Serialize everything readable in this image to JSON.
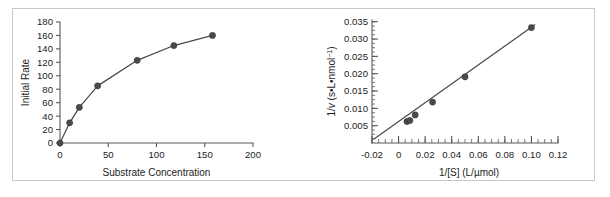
{
  "figure": {
    "background_color": "#ffffff",
    "frame_color": "#c8c8c8",
    "data_color": "#4a4a4c",
    "axis_color": "#58585a",
    "panel_count": 2
  },
  "chart_data": [
    {
      "type": "line",
      "id": "michaelis-menten-plot",
      "title": "",
      "xlabel": "Substrate Concentration",
      "ylabel": "Initial Rate",
      "xlim": [
        0,
        200
      ],
      "ylim": [
        0,
        180
      ],
      "xticks": [
        0,
        50,
        100,
        150,
        200
      ],
      "xticklabels": [
        "0",
        "50",
        "100",
        "150",
        "200"
      ],
      "yticks": [
        0,
        20,
        40,
        60,
        80,
        100,
        120,
        140,
        160,
        180
      ],
      "yticklabels": [
        "0",
        "20",
        "40",
        "60",
        "80",
        "100",
        "120",
        "140",
        "160",
        "180"
      ],
      "grid": false,
      "legend": null,
      "markers": true,
      "series": [
        {
          "name": "initial rate vs substrate concentration",
          "x": [
            0,
            10,
            20,
            39,
            80,
            118,
            158
          ],
          "y": [
            0,
            30,
            53,
            85,
            123,
            145,
            160
          ]
        }
      ]
    },
    {
      "type": "scatter",
      "id": "lineweaver-burk-plot",
      "title": "",
      "xlabel": "1/[S] (L/µmol)",
      "ylabel": "1/v (s•L•nmol⁻¹)",
      "ylabel_parts": {
        "prefix": "1/",
        "italic": "v",
        "suffix": " (s•L•nmol",
        "superscript": "−1",
        "tail": ")"
      },
      "xlim": [
        -0.02,
        0.12
      ],
      "ylim": [
        0.0,
        0.0355
      ],
      "xticks": [
        -0.02,
        0,
        0.02,
        0.04,
        0.06,
        0.08,
        0.1,
        0.12
      ],
      "xticklabels": [
        "-0.02",
        "0",
        "0.02",
        "0.04",
        "0.06",
        "0.08",
        "0.10",
        "0.12"
      ],
      "xminor_step": 0.005,
      "yticks": [
        0.005,
        0.01,
        0.015,
        0.02,
        0.025,
        0.03,
        0.035
      ],
      "yticklabels": [
        "0.005",
        "0.010",
        "0.015",
        "0.020",
        "0.025",
        "0.030",
        "0.035"
      ],
      "yminor_step": 0.00125,
      "grid": false,
      "legend": null,
      "markers": true,
      "fit_line": {
        "name": "least-squares fit",
        "x": [
          -0.0185,
          0.1025
        ],
        "y": [
          0.00115,
          0.0341
        ],
        "slope": 0.2724,
        "intercept": 0.00619
      },
      "series": [
        {
          "name": "1/v vs 1/[S]",
          "x": [
            0.0063,
            0.0085,
            0.0125,
            0.0256,
            0.05,
            0.1
          ],
          "y": [
            0.0062,
            0.0065,
            0.0081,
            0.0118,
            0.0191,
            0.0333
          ]
        }
      ]
    }
  ]
}
